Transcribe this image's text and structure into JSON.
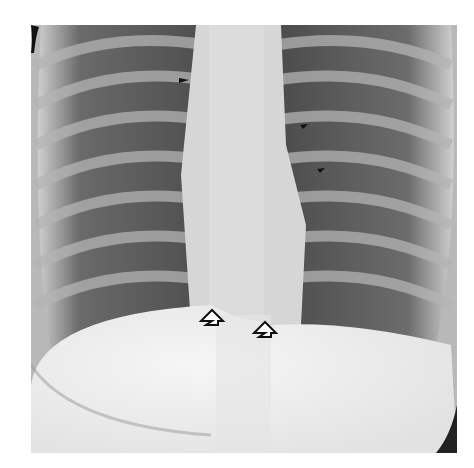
{
  "figure": {
    "type": "chest-radiograph-frontal",
    "colors": {
      "background": "#ffffff",
      "lung": "#5a5a5a",
      "bone": "#d8d8d8",
      "soft_tissue": "#eeeeee"
    },
    "annotations": {
      "open_arrows": [
        {
          "name": "open-arrow-left",
          "x": 212,
          "y": 315,
          "direction": "up"
        },
        {
          "name": "open-arrow-right",
          "x": 265,
          "y": 327,
          "direction": "up"
        }
      ],
      "small_arrowheads": [
        {
          "name": "small-arrow-1",
          "x": 184,
          "y": 80
        },
        {
          "name": "small-arrow-2",
          "x": 304,
          "y": 125
        },
        {
          "name": "small-arrow-3",
          "x": 321,
          "y": 169
        }
      ]
    }
  }
}
